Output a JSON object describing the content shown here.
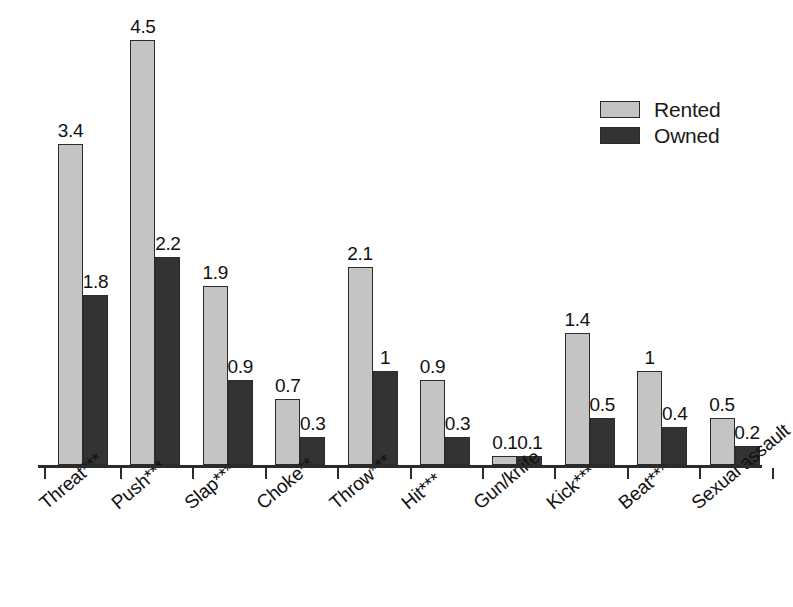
{
  "chart_data": {
    "type": "bar",
    "title": "",
    "subtitle": "",
    "xlabel": "",
    "ylabel": "",
    "ylim": [
      0,
      4.5
    ],
    "grid": false,
    "legend_position": "top-right",
    "categories": [
      "Threat***",
      "Push***",
      "Slap***",
      "Choke**",
      "Throw***",
      "Hit***",
      "Gun/knife",
      "Kick***",
      "Beat***",
      "Sexual assault"
    ],
    "series": [
      {
        "name": "Rented",
        "color": "#c4c4c4",
        "values": [
          3.4,
          4.5,
          1.9,
          0.7,
          2.1,
          0.9,
          0.1,
          1.4,
          1,
          0.5
        ],
        "labels": [
          "3.4",
          "4.5",
          "1.9",
          "0.7",
          "2.1",
          "0.9",
          "0.1",
          "1.4",
          "1",
          "0.5"
        ]
      },
      {
        "name": "Owned",
        "color": "#333333",
        "values": [
          1.8,
          2.2,
          0.9,
          0.3,
          1,
          0.3,
          0.1,
          0.5,
          0.4,
          0.2
        ],
        "labels": [
          "1.8",
          "2.2",
          "0.9",
          "0.3",
          "1",
          "0.3",
          "0.1",
          "0.5",
          "0.4",
          "0.2"
        ]
      }
    ]
  },
  "legend": {
    "items": [
      {
        "label": "Rented",
        "color": "#c4c4c4"
      },
      {
        "label": "Owned",
        "color": "#333333"
      }
    ]
  },
  "colors": {
    "rented": "#c4c4c4",
    "owned": "#333333",
    "axis": "#2b2b2b",
    "text": "#111111",
    "background": "#ffffff"
  }
}
